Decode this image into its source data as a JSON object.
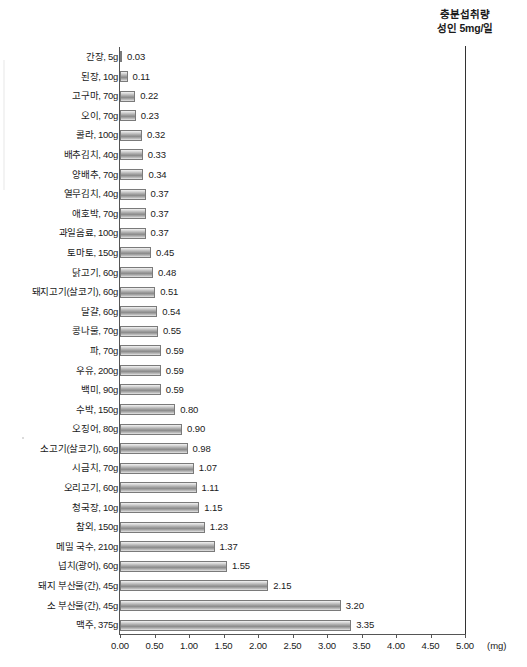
{
  "annotation": {
    "line1": "충분섭취량",
    "line2": "성인 5mg/일"
  },
  "axis": {
    "unit": "(mg)",
    "ticks": [
      "0.00",
      "0.50",
      "1.00",
      "1.50",
      "2.00",
      "2.50",
      "3.00",
      "3.50",
      "4.00",
      "4.50",
      "5.00"
    ]
  },
  "chart_data": {
    "type": "bar",
    "orientation": "horizontal",
    "title": "",
    "xlabel": "(mg)",
    "ylabel": "",
    "xlim": [
      0,
      5
    ],
    "xticks": [
      0,
      0.5,
      1,
      1.5,
      2,
      2.5,
      3,
      3.5,
      4,
      4.5,
      5
    ],
    "grid": false,
    "legend": false,
    "reference_line": {
      "value": 5,
      "label": "충분섭취량 성인 5mg/일",
      "position": "top-right"
    },
    "bar_color": "#9d9d9d",
    "bar_border_color": "#7a7a7a",
    "categories": [
      "간장, 5g",
      "된장, 10g",
      "고구마, 70g",
      "오이, 70g",
      "콜라, 100g",
      "배추김치, 40g",
      "양배추, 70g",
      "열무김치, 40g",
      "애호박, 70g",
      "과일음료, 100g",
      "토마토, 150g",
      "닭고기, 60g",
      "돼지고기(살코기), 60g",
      "달걀, 60g",
      "콩나물, 70g",
      "파, 70g",
      "우유, 200g",
      "백미, 90g",
      "수박, 150g",
      "오징어, 80g",
      "소고기(살코기), 60g",
      "시금치, 70g",
      "오리고기, 60g",
      "청국장, 10g",
      "참외, 150g",
      "메밀 국수, 210g",
      "넙치(광어), 60g",
      "돼지 부산물(간), 45g",
      "소 부산물(간), 45g",
      "맥주, 375g"
    ],
    "values": [
      0.03,
      0.11,
      0.22,
      0.23,
      0.32,
      0.33,
      0.34,
      0.37,
      0.37,
      0.37,
      0.45,
      0.48,
      0.51,
      0.54,
      0.55,
      0.59,
      0.59,
      0.59,
      0.8,
      0.9,
      0.98,
      1.07,
      1.11,
      1.15,
      1.23,
      1.37,
      1.55,
      2.15,
      3.2,
      3.35
    ],
    "value_labels": [
      "0.03",
      "0.11",
      "0.22",
      "0.23",
      "0.32",
      "0.33",
      "0.34",
      "0.37",
      "0.37",
      "0.37",
      "0.45",
      "0.48",
      "0.51",
      "0.54",
      "0.55",
      "0.59",
      "0.59",
      "0.59",
      "0.80",
      "0.90",
      "0.98",
      "1.07",
      "1.11",
      "1.15",
      "1.23",
      "1.37",
      "1.55",
      "2.15",
      "3.20",
      "3.35"
    ]
  }
}
